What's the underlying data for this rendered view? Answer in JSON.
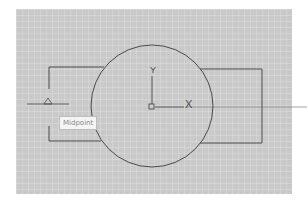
{
  "viewport": {
    "background_color": "#c9c9c9",
    "line_color": "#4a4a4a"
  },
  "ucs_icon": {
    "x_label": "X",
    "y_label": "Y"
  },
  "osnap_tooltip": {
    "label": "Midpoint"
  },
  "shapes": {
    "circle": {
      "cx": 152,
      "cy": 106,
      "r": 61
    },
    "left_bracket": "Left rectangle with open gap on left side",
    "right_rectangle": "Right rectangle behind circle"
  }
}
